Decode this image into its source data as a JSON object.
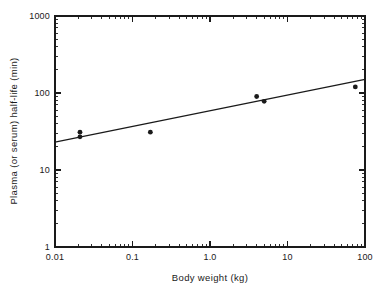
{
  "chart_data": {
    "type": "scatter",
    "title": "",
    "subtitle": "",
    "xlabel": "Body weight (kg)",
    "ylabel": "Plasma (or serum) half-life (min)",
    "xscale": "log",
    "yscale": "log",
    "xlim": [
      0.01,
      100
    ],
    "ylim": [
      1,
      1000
    ],
    "grid": false,
    "legend": null,
    "x_tick_labels": [
      "0.01",
      "0.1",
      "1.0",
      "10",
      "100"
    ],
    "x_tick_values": [
      0.01,
      0.1,
      1.0,
      10,
      100
    ],
    "y_tick_labels": [
      "1",
      "10",
      "100",
      "1000"
    ],
    "y_tick_values": [
      1,
      10,
      100,
      1000
    ],
    "minor_ticks": true,
    "points": [
      {
        "x": 0.021,
        "y": 31,
        "label": ""
      },
      {
        "x": 0.021,
        "y": 27,
        "label": ""
      },
      {
        "x": 0.17,
        "y": 31,
        "label": ""
      },
      {
        "x": 4.0,
        "y": 90,
        "label": ""
      },
      {
        "x": 5.0,
        "y": 78,
        "label": ""
      },
      {
        "x": 75,
        "y": 120,
        "label": ""
      }
    ],
    "series": [
      {
        "name": "Plasma half-life vs body weight",
        "x": [
          0.021,
          0.021,
          0.17,
          4.0,
          5.0,
          75
        ],
        "values": [
          31,
          27,
          31,
          90,
          78,
          120
        ]
      }
    ],
    "fit_line": {
      "type": "power-law regression",
      "x_start": 0.01,
      "y_start": 23,
      "x_end": 100,
      "y_end": 150
    },
    "marker": {
      "shape": "filled-circle",
      "color": "#1a1a1a",
      "size_px": 4.6
    },
    "line_color": "#1a1a1a",
    "background_color": "#ffffff"
  },
  "axes": {
    "x": {
      "title": "Body weight (kg)",
      "ticks": [
        {
          "value": 0.01,
          "label": "0.01"
        },
        {
          "value": 0.1,
          "label": "0.1"
        },
        {
          "value": 1.0,
          "label": "1.0"
        },
        {
          "value": 10,
          "label": "10"
        },
        {
          "value": 100,
          "label": "100"
        }
      ]
    },
    "y": {
      "title": "Plasma (or serum) half-life (min)",
      "ticks": [
        {
          "value": 1,
          "label": "1"
        },
        {
          "value": 10,
          "label": "10"
        },
        {
          "value": 100,
          "label": "100"
        },
        {
          "value": 1000,
          "label": "1000"
        }
      ]
    }
  }
}
